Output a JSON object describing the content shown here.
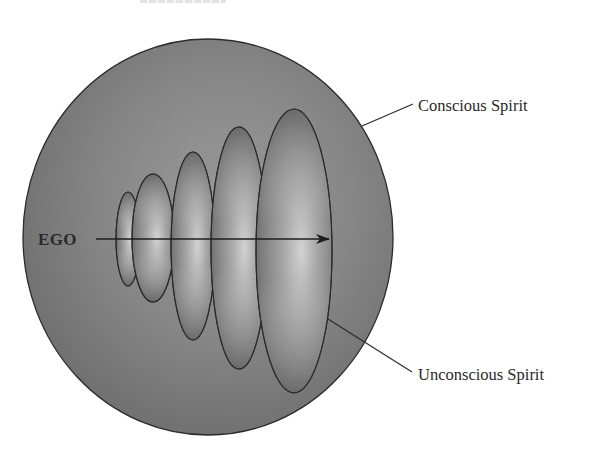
{
  "figure": {
    "type": "diagram",
    "description_visible": "Concentric growth of consciousness from ego into spirit",
    "labels": {
      "ego": "EGO",
      "outer": "Conscious Spirit",
      "inner": "Unconscious Spirit"
    },
    "colors": {
      "background": "#ffffff",
      "sphere_light": "#9a9a9a",
      "sphere_mid": "#858585",
      "sphere_dark": "#6c6c6c",
      "shell_highlight": "#d0d0d0",
      "shell_mid": "#9c9c9c",
      "shell_dark": "#626262",
      "stroke": "#2b2b2b",
      "text": "#2a2a2a"
    },
    "sphere": {
      "cx": 208,
      "cy": 237,
      "rx": 185,
      "ry": 198
    },
    "shells": [
      {
        "id": 1,
        "cx": 128,
        "cy": 239,
        "rx": 12,
        "ry": 47
      },
      {
        "id": 2,
        "cx": 153,
        "cy": 238,
        "rx": 21,
        "ry": 64
      },
      {
        "id": 3,
        "cx": 193,
        "cy": 246,
        "rx": 22,
        "ry": 94
      },
      {
        "id": 4,
        "cx": 239,
        "cy": 248,
        "rx": 28,
        "ry": 121
      },
      {
        "id": 5,
        "cx": 294,
        "cy": 251,
        "rx": 38,
        "ry": 142
      }
    ],
    "arrow": {
      "x1": 96,
      "y1": 239,
      "x2": 329,
      "y2": 239
    },
    "leaders": {
      "outer": {
        "x1": 362,
        "y1": 126,
        "x2": 413,
        "y2": 104,
        "text_x": 418,
        "text_y": 111
      },
      "inner": {
        "x1": 328,
        "y1": 319,
        "x2": 412,
        "y2": 372,
        "text_x": 418,
        "text_y": 380
      }
    },
    "ego_label_pos": {
      "x": 38,
      "y": 245
    }
  }
}
